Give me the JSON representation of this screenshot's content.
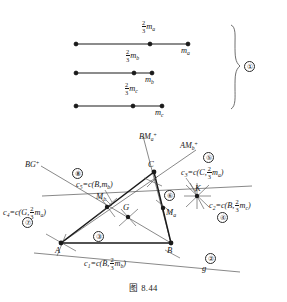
{
  "figure": {
    "caption": "图 8.44",
    "group_marker": "①"
  },
  "median_segments": {
    "bracket_label": "①",
    "items": [
      {
        "id": "segment-ma",
        "fraction_num": "2",
        "fraction_den": "3",
        "fraction_var": "m",
        "fraction_sub": "a",
        "end_label_var": "m",
        "end_label_sub": "a"
      },
      {
        "id": "segment-mb",
        "fraction_num": "2",
        "fraction_den": "3",
        "fraction_var": "m",
        "fraction_sub": "b",
        "end_label_var": "m",
        "end_label_sub": "b"
      },
      {
        "id": "segment-mc",
        "fraction_num": "2",
        "fraction_den": "3",
        "fraction_var": "m",
        "fraction_sub": "c",
        "end_label_var": "m",
        "end_label_sub": "c"
      }
    ]
  },
  "triangle": {
    "vertices": [
      {
        "name": "A",
        "label": "A"
      },
      {
        "name": "B",
        "label": "B"
      },
      {
        "name": "C",
        "label": "C"
      }
    ],
    "points": [
      {
        "name": "M_b",
        "var": "M",
        "sub": "b"
      },
      {
        "name": "M_a",
        "var": "M",
        "sub": "a"
      },
      {
        "name": "G",
        "var": "G",
        "sub": ""
      },
      {
        "name": "K",
        "var": "K",
        "sub": ""
      }
    ],
    "rays": [
      {
        "name": "BG-ray",
        "base": "BG",
        "sup": "+"
      },
      {
        "name": "BMa-ray",
        "base": "BM",
        "sub": "a",
        "sup": "+"
      },
      {
        "name": "AMb-ray",
        "base": "AM",
        "sub": "b",
        "sup": "+"
      }
    ],
    "line_g": "g",
    "circle_labels": [
      {
        "name": "c1",
        "var": "c",
        "sub": "1",
        "center": "B",
        "num": "2",
        "den": "3",
        "radius_var": "m",
        "radius_sub": "b",
        "step": "②"
      },
      {
        "name": "c2",
        "var": "c",
        "sub": "2",
        "center": "B",
        "num": "2",
        "den": "3",
        "radius_var": "m",
        "radius_sub": "c",
        "step": "④"
      },
      {
        "name": "c3",
        "var": "c",
        "sub": "3",
        "center": "C",
        "num": "2",
        "den": "3",
        "radius_var": "m",
        "radius_sub": "a",
        "step": "⑤"
      },
      {
        "name": "c4",
        "var": "c",
        "sub": "4",
        "center": "G",
        "num": "2",
        "den": "3",
        "radius_var": "m",
        "radius_sub": "a",
        "step": "⑦"
      },
      {
        "name": "c5",
        "var": "c",
        "sub": "5",
        "center": "B",
        "num": "",
        "den": "",
        "radius_var": "m",
        "radius_sub": "b",
        "step": "⑧"
      }
    ],
    "step_markers": [
      "②",
      "③",
      "④",
      "⑤",
      "⑥",
      "⑦",
      "⑧"
    ]
  },
  "colors": {
    "ink": "#1a1a1a",
    "thin": "#555555",
    "background": "#ffffff"
  }
}
